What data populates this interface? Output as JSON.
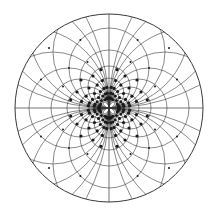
{
  "diagram": {
    "type": "dipole field-line pattern inside a circle",
    "width": 213,
    "height": 211,
    "center": [
      109,
      108
    ],
    "radius": 94,
    "colors": {
      "background": "#ffffff",
      "line": "#3a3a3a",
      "dot": "#1a1a1a"
    },
    "families": {
      "horizontal_tangent_radii": [
        6,
        10,
        15,
        21,
        29,
        40,
        56,
        80,
        120,
        190
      ],
      "vertical_tangent_radii": [
        6,
        10,
        15,
        21,
        29,
        40,
        56,
        80,
        120,
        190
      ]
    }
  }
}
